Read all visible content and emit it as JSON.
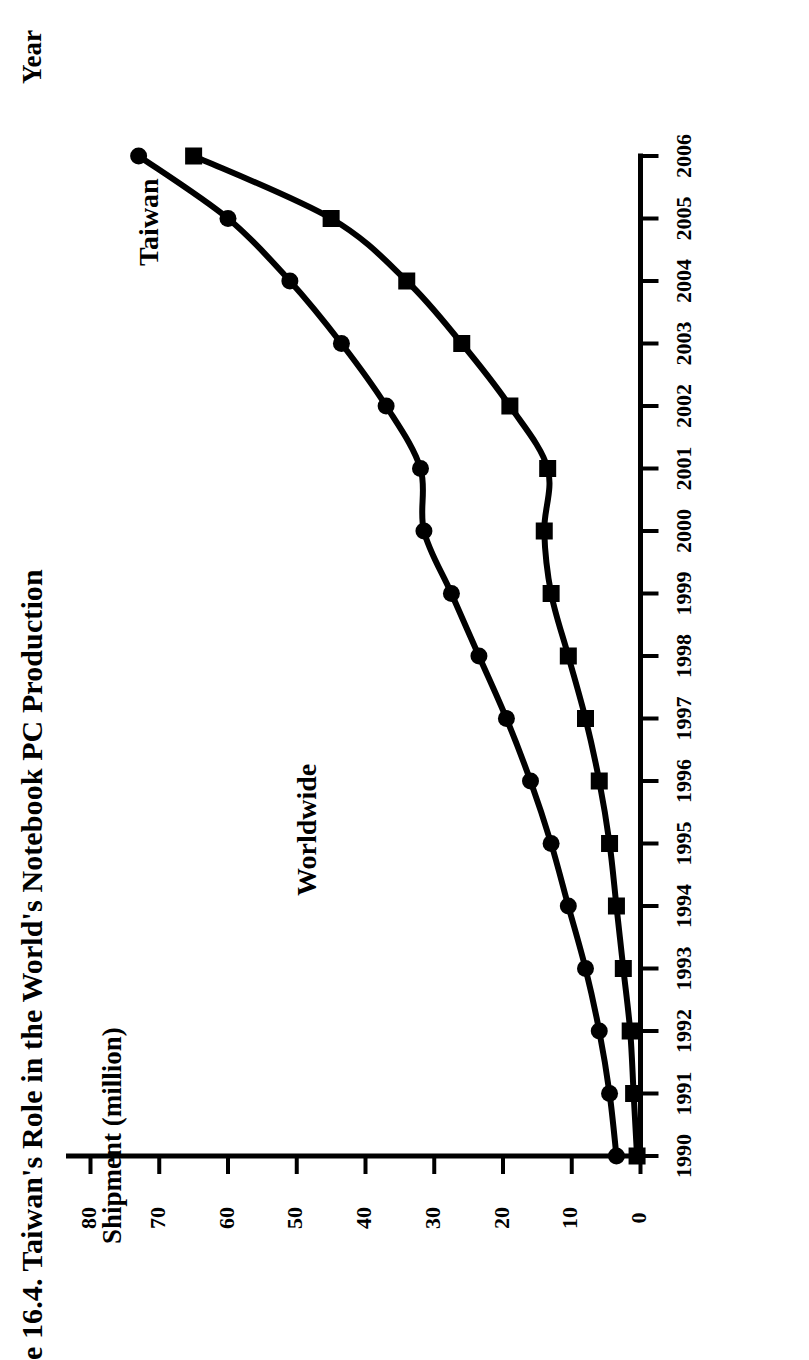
{
  "figure": {
    "title": "e 16.4. Taiwan's Role in the World's Notebook PC Production",
    "title_note_visible_truncated": true
  },
  "axes": {
    "y_axis_label": "Shipment (million)",
    "x_axis_label": "Year",
    "y_ticks": [
      "0",
      "10",
      "20",
      "30",
      "40",
      "50",
      "60",
      "70",
      "80"
    ],
    "x_ticks": [
      "1990",
      "1991",
      "1992",
      "1993",
      "1994",
      "1995",
      "1996",
      "1997",
      "1998",
      "1999",
      "2000",
      "2001",
      "2002",
      "2003",
      "2004",
      "2005",
      "2006"
    ]
  },
  "series_labels": {
    "worldwide": "Worldwide",
    "taiwan": "Taiwan"
  },
  "colors": {
    "ink": "#000000",
    "background": "#ffffff"
  },
  "chart_data": {
    "type": "line",
    "title": "e 16.4. Taiwan's Role in the World's Notebook PC Production",
    "xlabel": "Year",
    "ylabel": "Shipment (million)",
    "x": [
      1990,
      1991,
      1992,
      1993,
      1994,
      1995,
      1996,
      1997,
      1998,
      1999,
      2000,
      2001,
      2002,
      2003,
      2004,
      2005,
      2006
    ],
    "xlim": [
      1990,
      2006
    ],
    "ylim": [
      0,
      80
    ],
    "grid": false,
    "legend": "inline-labels",
    "series": [
      {
        "name": "Worldwide",
        "marker": "circle",
        "values": [
          3.5,
          4.5,
          6.0,
          8.0,
          10.5,
          13.0,
          16.0,
          19.5,
          23.5,
          27.5,
          31.5,
          32.0,
          37.0,
          43.5,
          51.0,
          60.0,
          73.0
        ]
      },
      {
        "name": "Taiwan",
        "marker": "square",
        "values": [
          0.5,
          1.0,
          1.5,
          2.5,
          3.5,
          4.5,
          6.0,
          8.0,
          10.5,
          13.0,
          14.0,
          13.5,
          19.0,
          26.0,
          34.0,
          45.0,
          65.0
        ]
      }
    ]
  }
}
